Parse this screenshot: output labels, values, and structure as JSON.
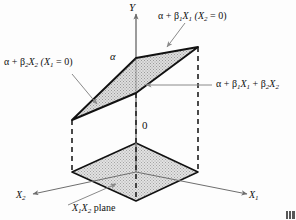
{
  "figure": {
    "axes": {
      "y_axis_label": "Y",
      "x1_axis_label": "X",
      "x1_axis_sub": "1",
      "x2_axis_label": "X",
      "x2_axis_sub": "2",
      "origin_label": "0",
      "intercept_label": "α"
    },
    "annotations": {
      "top_right": {
        "text": "α + β",
        "sub1": "1",
        "var1": "X",
        "sub2": "1",
        "paren_open": "(X",
        "paren_sub": "2",
        "paren_close": " = 0)",
        "full": "α + β1X1 (X2 = 0)"
      },
      "left": {
        "text": "α + β",
        "sub1": "2",
        "var1": "X",
        "sub2": "2",
        "paren_open": "(X",
        "paren_sub": "1",
        "paren_close": " = 0)",
        "full": "α + β2X2 (X1 = 0)"
      },
      "right": {
        "full": "α + β1X1 + β2X2"
      },
      "bottom": {
        "var1": "X",
        "sub1": "1",
        "var2": "X",
        "sub2": "2",
        "suffix": " plane",
        "full": "X1X2 plane"
      }
    },
    "colors": {
      "line": "#111111",
      "plane_fill": "#d8d8d8",
      "axis": "#6e6e6e",
      "dashed": "#2b2b2b",
      "leader": "#8a8a8a",
      "background": "#fdfdfd"
    }
  }
}
